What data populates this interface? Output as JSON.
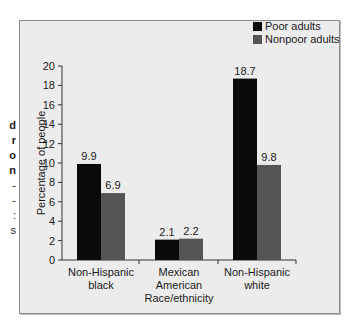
{
  "cropped_side_text": [
    "d",
    "r",
    "o",
    "n",
    "-",
    "-",
    ":",
    "s"
  ],
  "chart_data": {
    "type": "bar",
    "title": "",
    "xlabel": "Race/ethnicity",
    "ylabel": "Percentage of people",
    "ylim": [
      0,
      20
    ],
    "yticks": [
      0,
      2,
      4,
      6,
      8,
      10,
      12,
      14,
      16,
      18,
      20
    ],
    "grid": false,
    "legend_position": "top-right",
    "categories": [
      "Non-Hispanic black",
      "Mexican American",
      "Non-Hispanic white"
    ],
    "category_lines": [
      [
        "Non-Hispanic",
        "black"
      ],
      [
        "Mexican",
        "American"
      ],
      [
        "Non-Hispanic",
        "white"
      ]
    ],
    "series": [
      {
        "name": "Poor adults",
        "color": "#0a0a0a",
        "values": [
          9.9,
          2.1,
          18.7
        ],
        "labels": [
          "9.9",
          "2.1",
          "18.7"
        ]
      },
      {
        "name": "Nonpoor adults",
        "color": "#555555",
        "values": [
          6.9,
          2.2,
          9.8
        ],
        "labels": [
          "6.9",
          "2.2",
          "9.8"
        ]
      }
    ]
  }
}
